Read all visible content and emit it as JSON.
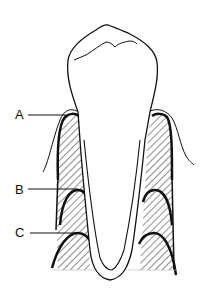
{
  "diagram": {
    "labels": [
      {
        "id": "A",
        "text": "A",
        "target": "alveolar crest level (bone crest near cementoenamel junction)"
      },
      {
        "id": "B",
        "text": "B",
        "target": "first reduced bone level"
      },
      {
        "id": "C",
        "text": "C",
        "target": "further reduced bone level"
      }
    ],
    "colors": {
      "line": "#111111",
      "background": "#ffffff",
      "hatch": "#222222"
    }
  }
}
